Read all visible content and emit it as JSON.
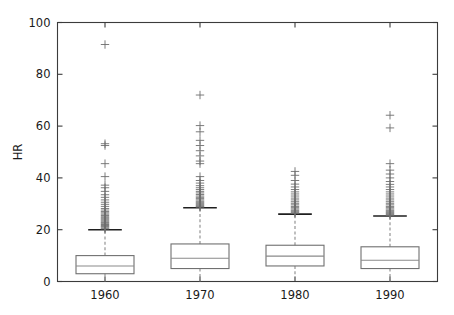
{
  "figure": {
    "background_color": "#ffffff",
    "frame_color": "#3b3b3b",
    "box_color": "#707070",
    "median_color": "#8a8a8a",
    "whisker_color": "#8a8a8a",
    "cap_color": "#1f1f1f",
    "flier_color": "#6d6d6d"
  },
  "chart_data": {
    "type": "box",
    "title": "",
    "xlabel": "",
    "ylabel": "HR",
    "categories": [
      "1960",
      "1970",
      "1980",
      "1990"
    ],
    "xtick_labels": [
      "1960",
      "1970",
      "1980",
      "1990"
    ],
    "ytick_labels": [
      "0",
      "20",
      "40",
      "60",
      "80",
      "100"
    ],
    "yticks": [
      0,
      20,
      40,
      60,
      80,
      100
    ],
    "ylim": [
      0,
      100
    ],
    "grid": false,
    "legend": null,
    "flier_marker": "+",
    "whisker_style": "dashed",
    "boxes": [
      {
        "category": "1960",
        "whisker_low": 0,
        "q1": 3,
        "median": 6,
        "q3": 10,
        "whisker_high": 20,
        "fliers": [
          20.3,
          20.6,
          21,
          21.3,
          21.6,
          22,
          22.3,
          22.7,
          23,
          23.4,
          23.8,
          24.2,
          24.6,
          25,
          25.5,
          26,
          26.5,
          27,
          27.6,
          28.2,
          29,
          29.8,
          30.6,
          31.5,
          32.5,
          33.5,
          34.8,
          36.2,
          37.2,
          40.5,
          45.5,
          52.5,
          53.2,
          91.5
        ]
      },
      {
        "category": "1970",
        "whisker_low": 0,
        "q1": 5,
        "median": 9,
        "q3": 14.5,
        "whisker_high": 28.5,
        "fliers": [
          28.7,
          29,
          29.4,
          29.8,
          30.2,
          30.6,
          31,
          31.5,
          32,
          32.5,
          33,
          33.6,
          34.2,
          34.8,
          35.5,
          36.2,
          37,
          38,
          39,
          40.5,
          45.5,
          46.5,
          48.5,
          50.5,
          52.5,
          54.5,
          57.8,
          60.2,
          72
        ]
      },
      {
        "category": "1980",
        "whisker_low": 0,
        "q1": 6,
        "median": 9.8,
        "q3": 14,
        "whisker_high": 26,
        "fliers": [
          26.3,
          26.7,
          27.1,
          27.5,
          28,
          28.5,
          29,
          29.6,
          30.2,
          30.8,
          31.5,
          32.2,
          33,
          33.8,
          34.6,
          35.5,
          36.5,
          37.6,
          39,
          41,
          42.5
        ]
      },
      {
        "category": "1990",
        "whisker_low": 0,
        "q1": 5,
        "median": 8.2,
        "q3": 13.4,
        "whisker_high": 25.3,
        "fliers": [
          25.5,
          25.9,
          26.3,
          26.7,
          27.1,
          27.5,
          28,
          28.5,
          29,
          29.6,
          30.2,
          30.8,
          31.5,
          32.2,
          33,
          33.8,
          34.6,
          35.5,
          36.5,
          37.5,
          38.6,
          40,
          41.5,
          43,
          45.5,
          59.3,
          64.2
        ]
      }
    ]
  }
}
